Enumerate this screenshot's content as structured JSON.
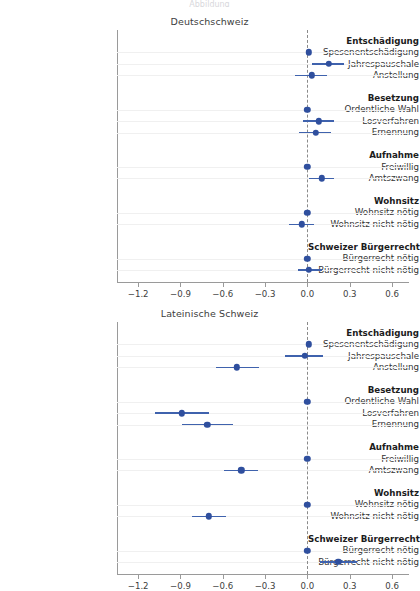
{
  "figure": {
    "width": 419,
    "height": 573,
    "background": "#ffffff",
    "marker_color": "#2f4f9e",
    "ci_color": "#3f62ad",
    "gridline_color": "#f0f0f0",
    "axis_color": "#9a9a9a",
    "zeroline_color": "#8a8a8a",
    "cropped_header_text": "Abbildung"
  },
  "axis": {
    "ticks": [
      -1.2,
      -0.9,
      -0.6,
      -0.3,
      0.0,
      0.3,
      0.6
    ],
    "tick_labels": [
      "−1.2",
      "−0.9",
      "−0.6",
      "−0.3",
      "0.0",
      "0.3",
      "0.6"
    ],
    "xlim": [
      -1.35,
      0.72
    ],
    "zero_reference": 0.0
  },
  "rows": [
    {
      "label": "Entschädigung",
      "type": "group"
    },
    {
      "label": "Spesenentschädigung",
      "type": "item"
    },
    {
      "label": "Jahrespauschale",
      "type": "item"
    },
    {
      "label": "Anstellung",
      "type": "item"
    },
    {
      "label": "",
      "type": "spacer"
    },
    {
      "label": "Besetzung",
      "type": "group"
    },
    {
      "label": "Ordentliche Wahl",
      "type": "item"
    },
    {
      "label": "Losverfahren",
      "type": "item"
    },
    {
      "label": "Ernennung",
      "type": "item"
    },
    {
      "label": "",
      "type": "spacer"
    },
    {
      "label": "Aufnahme",
      "type": "group"
    },
    {
      "label": "Freiwillig",
      "type": "item"
    },
    {
      "label": "Amtszwang",
      "type": "item"
    },
    {
      "label": "",
      "type": "spacer"
    },
    {
      "label": "Wohnsitz",
      "type": "group"
    },
    {
      "label": "Wohnsitz nötig",
      "type": "item"
    },
    {
      "label": "Wohnsitz nicht nötig",
      "type": "item"
    },
    {
      "label": "",
      "type": "spacer"
    },
    {
      "label": "Schweizer Bürgerrecht",
      "type": "group"
    },
    {
      "label": "Bürgerrecht nötig",
      "type": "item"
    },
    {
      "label": "Bürgerrecht nicht nötig",
      "type": "item"
    }
  ],
  "chart_data": [
    {
      "type": "scatter",
      "title": "Deutschschweiz",
      "xlabel": "",
      "ylabel": "",
      "xlim": [
        -1.35,
        0.72
      ],
      "xticks": [
        -1.2,
        -0.9,
        -0.6,
        -0.3,
        0.0,
        0.3,
        0.6
      ],
      "grid": true,
      "legend": "none",
      "zero_reference_line": 0.0,
      "points": [
        {
          "label": "Spesenentschädigung",
          "estimate": 0.01,
          "ci_low": 0.01,
          "ci_high": 0.01,
          "reference": true
        },
        {
          "label": "Jahrespauschale",
          "estimate": 0.15,
          "ci_low": 0.03,
          "ci_high": 0.26
        },
        {
          "label": "Anstellung",
          "estimate": 0.03,
          "ci_low": -0.09,
          "ci_high": 0.14
        },
        {
          "label": "Ordentliche Wahl",
          "estimate": 0.0,
          "ci_low": 0.0,
          "ci_high": 0.0,
          "reference": true
        },
        {
          "label": "Losverfahren",
          "estimate": 0.08,
          "ci_low": -0.03,
          "ci_high": 0.19
        },
        {
          "label": "Ernennung",
          "estimate": 0.06,
          "ci_low": -0.06,
          "ci_high": 0.17
        },
        {
          "label": "Freiwillig",
          "estimate": 0.0,
          "ci_low": 0.0,
          "ci_high": 0.0,
          "reference": true
        },
        {
          "label": "Amtszwang",
          "estimate": 0.1,
          "ci_low": 0.01,
          "ci_high": 0.19
        },
        {
          "label": "Wohnsitz nötig",
          "estimate": 0.0,
          "ci_low": 0.0,
          "ci_high": 0.0,
          "reference": true
        },
        {
          "label": "Wohnsitz nicht nötig",
          "estimate": -0.04,
          "ci_low": -0.13,
          "ci_high": 0.05
        },
        {
          "label": "Bürgerrecht nötig",
          "estimate": 0.0,
          "ci_low": 0.0,
          "ci_high": 0.0,
          "reference": true
        },
        {
          "label": "Bürgerrecht nicht nötig",
          "estimate": 0.01,
          "ci_low": -0.07,
          "ci_high": 0.1
        }
      ]
    },
    {
      "type": "scatter",
      "title": "Lateinische Schweiz",
      "xlabel": "",
      "ylabel": "",
      "xlim": [
        -1.35,
        0.72
      ],
      "xticks": [
        -1.2,
        -0.9,
        -0.6,
        -0.3,
        0.0,
        0.3,
        0.6
      ],
      "grid": true,
      "legend": "none",
      "zero_reference_line": 0.0,
      "points": [
        {
          "label": "Spesenentschädigung",
          "estimate": 0.01,
          "ci_low": 0.01,
          "ci_high": 0.01,
          "reference": true
        },
        {
          "label": "Jahrespauschale",
          "estimate": -0.02,
          "ci_low": -0.16,
          "ci_high": 0.11
        },
        {
          "label": "Anstellung",
          "estimate": -0.5,
          "ci_low": -0.65,
          "ci_high": -0.34
        },
        {
          "label": "Ordentliche Wahl",
          "estimate": 0.0,
          "ci_low": 0.0,
          "ci_high": 0.0,
          "reference": true
        },
        {
          "label": "Losverfahren",
          "estimate": -0.89,
          "ci_low": -1.08,
          "ci_high": -0.7
        },
        {
          "label": "Ernennung",
          "estimate": -0.71,
          "ci_low": -0.89,
          "ci_high": -0.53
        },
        {
          "label": "Freiwillig",
          "estimate": 0.0,
          "ci_low": 0.0,
          "ci_high": 0.0,
          "reference": true
        },
        {
          "label": "Amtszwang",
          "estimate": -0.47,
          "ci_low": -0.59,
          "ci_high": -0.35
        },
        {
          "label": "Wohnsitz nötig",
          "estimate": 0.0,
          "ci_low": 0.0,
          "ci_high": 0.0,
          "reference": true
        },
        {
          "label": "Wohnsitz nicht nötig",
          "estimate": -0.7,
          "ci_low": -0.82,
          "ci_high": -0.58
        },
        {
          "label": "Bürgerrecht nötig",
          "estimate": 0.0,
          "ci_low": 0.0,
          "ci_high": 0.0,
          "reference": true
        },
        {
          "label": "Bürgerrecht nicht nötig",
          "estimate": 0.22,
          "ci_low": 0.09,
          "ci_high": 0.35
        }
      ]
    }
  ]
}
